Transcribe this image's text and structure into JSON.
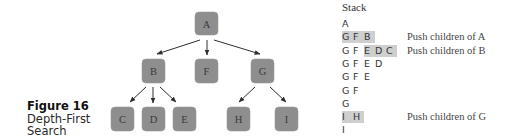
{
  "figure": {
    "label": "Figure 16",
    "title_line1": "Depth-First",
    "title_line2": "Search"
  },
  "tree": {
    "nodes": [
      {
        "id": "A",
        "label": "A"
      },
      {
        "id": "B",
        "label": "B"
      },
      {
        "id": "F",
        "label": "F"
      },
      {
        "id": "G",
        "label": "G"
      },
      {
        "id": "C",
        "label": "C"
      },
      {
        "id": "D",
        "label": "D"
      },
      {
        "id": "E",
        "label": "E"
      },
      {
        "id": "H",
        "label": "H"
      },
      {
        "id": "I",
        "label": "I"
      }
    ],
    "edges": [
      [
        "A",
        "B"
      ],
      [
        "A",
        "F"
      ],
      [
        "A",
        "G"
      ],
      [
        "B",
        "C"
      ],
      [
        "B",
        "D"
      ],
      [
        "B",
        "E"
      ],
      [
        "G",
        "H"
      ],
      [
        "G",
        "I"
      ]
    ],
    "node_color": "#8e8e8e"
  },
  "stack": {
    "title": "Stack",
    "rows": [
      {
        "items": [
          "A"
        ],
        "highlight_from": null,
        "note": ""
      },
      {
        "items": [
          "G",
          "F",
          "B"
        ],
        "highlight_from": 0,
        "note": "Push children of A"
      },
      {
        "items": [
          "G",
          "F",
          "E",
          "D",
          "C"
        ],
        "highlight_from": 2,
        "note": "Push children of B"
      },
      {
        "items": [
          "G",
          "F",
          "E",
          "D"
        ],
        "highlight_from": null,
        "note": ""
      },
      {
        "items": [
          "G",
          "F",
          "E"
        ],
        "highlight_from": null,
        "note": ""
      },
      {
        "items": [
          "G",
          "F"
        ],
        "highlight_from": null,
        "note": ""
      },
      {
        "items": [
          "G"
        ],
        "highlight_from": null,
        "note": ""
      },
      {
        "items": [
          "I",
          "H"
        ],
        "highlight_from": 0,
        "note": "Push children of G"
      },
      {
        "items": [
          "I"
        ],
        "highlight_from": null,
        "note": ""
      }
    ],
    "highlight_color": "#cfcfcf"
  }
}
